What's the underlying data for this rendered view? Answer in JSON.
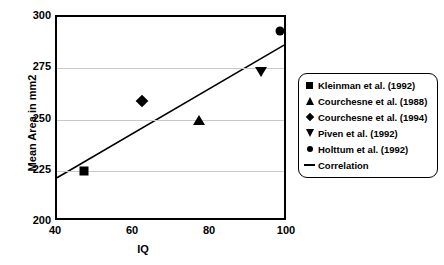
{
  "chart_data": {
    "type": "scatter",
    "title": "",
    "xlabel": "IQ",
    "ylabel": "Mean Area in mm2",
    "xlim": [
      40,
      100
    ],
    "ylim": [
      200,
      300
    ],
    "xticks": [
      "40",
      "60",
      "80",
      "100"
    ],
    "xtick_values": [
      40,
      60,
      80,
      100
    ],
    "yticks": [
      "200",
      "225",
      "250",
      "275",
      "300"
    ],
    "ytick_values": [
      200,
      225,
      250,
      275,
      300
    ],
    "grid": "horizontal",
    "legend_position": "right",
    "series": [
      {
        "name": "Kleinman et al. (1992)",
        "marker": "square",
        "x": [
          47
        ],
        "y": [
          225
        ]
      },
      {
        "name": "Courchesne et al. (1988)",
        "marker": "triangle-up",
        "x": [
          77
        ],
        "y": [
          250
        ]
      },
      {
        "name": "Courchesne et al. (1994)",
        "marker": "diamond",
        "x": [
          62
        ],
        "y": [
          259
        ]
      },
      {
        "name": "Piven et al. (1992)",
        "marker": "triangle-down",
        "x": [
          93
        ],
        "y": [
          273
        ]
      },
      {
        "name": "Holttum et al. (1992)",
        "marker": "circle",
        "x": [
          98
        ],
        "y": [
          293
        ]
      }
    ],
    "trendline": {
      "name": "Correlation",
      "marker": "line",
      "x": [
        40,
        100
      ],
      "y": [
        220,
        286
      ]
    },
    "points": [
      {
        "label": "Kleinman et al. (1992)",
        "marker": "square",
        "iq": 47,
        "mean_area": 225
      },
      {
        "label": "Courchesne et al. (1994)",
        "marker": "diamond",
        "iq": 62,
        "mean_area": 259
      },
      {
        "label": "Courchesne et al. (1988)",
        "marker": "triangle-up",
        "iq": 77,
        "mean_area": 250
      },
      {
        "label": "Piven et al. (1992)",
        "marker": "triangle-down",
        "iq": 93,
        "mean_area": 273
      },
      {
        "label": "Holttum et al. (1992)",
        "marker": "circle",
        "iq": 98,
        "mean_area": 293
      }
    ]
  },
  "legend": {
    "items": [
      {
        "key": "square",
        "label": "Kleinman et al. (1992)"
      },
      {
        "key": "triangle-up",
        "label": "Courchesne et al. (1988)"
      },
      {
        "key": "diamond",
        "label": "Courchesne et al. (1994)"
      },
      {
        "key": "triangle-down",
        "label": "Piven et al. (1992)"
      },
      {
        "key": "circle",
        "label": "Holttum et al. (1992)"
      },
      {
        "key": "line",
        "label": "Correlation"
      }
    ]
  },
  "colors": {
    "marker": "#000000",
    "gridline": "#c9c9c9",
    "axis": "#000000",
    "background": "#ffffff"
  }
}
